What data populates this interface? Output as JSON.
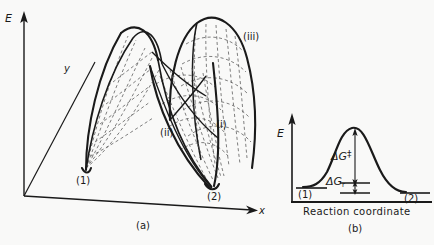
{
  "figure": {
    "panel_a": {
      "caption": "(a)",
      "axis_energy": "E",
      "axis_y": "y",
      "axis_x": "x",
      "state_start": "(1)",
      "state_end": "(2)",
      "surface_labels": {
        "i": "(i)",
        "ii": "(ii)",
        "iii": "(iii)"
      }
    },
    "panel_b": {
      "caption": "(b)",
      "axis_energy": "E",
      "axis_x_label": "Reaction coordinate",
      "state_start": "(1)",
      "state_end": "(2)",
      "activation_energy": "ΔG",
      "activation_energy_superscript": "‡",
      "reaction_energy": "ΔG",
      "reaction_energy_subscript": "r"
    }
  },
  "colors": {
    "background": "#f9f9f8",
    "ink": "#1a1a1a",
    "dashed": "#4a4a4a"
  }
}
